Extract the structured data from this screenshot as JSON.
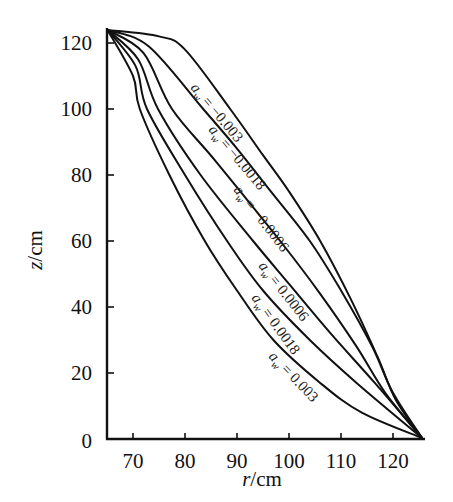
{
  "chart_data": {
    "type": "line",
    "title": "",
    "xlabel": "r/cm",
    "ylabel": "z/cm",
    "xlim": [
      66.5,
      123
    ],
    "ylim": [
      0,
      125
    ],
    "xticks": [
      70,
      80,
      90,
      100,
      110,
      120
    ],
    "yticks": [
      0,
      20,
      40,
      60,
      80,
      100,
      120
    ],
    "grid": false,
    "legend": "inline labels along curves",
    "series": [
      {
        "name": "a_w = -0.003",
        "label": "= −0.003",
        "points": [
          [
            67,
            125
          ],
          [
            75,
            122
          ],
          [
            80,
            118
          ],
          [
            88.7,
            100
          ],
          [
            95,
            86
          ],
          [
            100,
            75
          ],
          [
            106,
            60
          ],
          [
            112,
            42
          ],
          [
            117,
            25
          ],
          [
            120.5,
            12
          ],
          [
            123,
            0
          ]
        ]
      },
      {
        "name": "a_w = -0.0018",
        "label": "= −0.0018",
        "points": [
          [
            67,
            125
          ],
          [
            73,
            119
          ],
          [
            83.5,
            100
          ],
          [
            90,
            88
          ],
          [
            96,
            76
          ],
          [
            104,
            60
          ],
          [
            110,
            45
          ],
          [
            116,
            28
          ],
          [
            120,
            14
          ],
          [
            123,
            0
          ]
        ]
      },
      {
        "name": "a_w = -0.0006",
        "label": "= −0.0006",
        "points": [
          [
            67,
            125
          ],
          [
            72,
            117
          ],
          [
            77.5,
            100
          ],
          [
            86,
            84
          ],
          [
            98.3,
            60
          ],
          [
            106,
            44
          ],
          [
            113,
            28
          ],
          [
            118.5,
            14
          ],
          [
            123,
            0
          ]
        ]
      },
      {
        "name": "a_w = 0.0006",
        "label": "= 0.0006",
        "points": [
          [
            67,
            125
          ],
          [
            71,
            115
          ],
          [
            74.8,
            100
          ],
          [
            83,
            80
          ],
          [
            93.1,
            60
          ],
          [
            100,
            47
          ],
          [
            108,
            32
          ],
          [
            116.5,
            17
          ],
          [
            123,
            0
          ]
        ]
      },
      {
        "name": "a_w = 0.0018",
        "label": "= 0.0018",
        "points": [
          [
            67,
            125
          ],
          [
            70.5,
            113
          ],
          [
            72.7,
            100
          ],
          [
            80,
            80
          ],
          [
            88.1,
            60
          ],
          [
            95,
            45
          ],
          [
            104,
            30
          ],
          [
            113,
            17
          ],
          [
            123,
            0
          ]
        ]
      },
      {
        "name": "a_w = 0.003",
        "label": "= 0.003",
        "points": [
          [
            67,
            125
          ],
          [
            70,
            110
          ],
          [
            71.3,
            100
          ],
          [
            77,
            80
          ],
          [
            83.8,
            60
          ],
          [
            90,
            45
          ],
          [
            97,
            30
          ],
          [
            106,
            17
          ],
          [
            114,
            8
          ],
          [
            123,
            0
          ]
        ]
      }
    ]
  },
  "axes": {
    "x_title_var": "r",
    "x_title_unit": "/cm",
    "y_title_var": "z",
    "y_title_unit": "/cm",
    "x_tick_labels": [
      "70",
      "80",
      "90",
      "100",
      "110",
      "120"
    ],
    "y_tick_labels": [
      "0",
      "20",
      "40",
      "60",
      "80",
      "100",
      "120"
    ]
  },
  "labels": {
    "symbol": "a",
    "subscript": "w"
  }
}
